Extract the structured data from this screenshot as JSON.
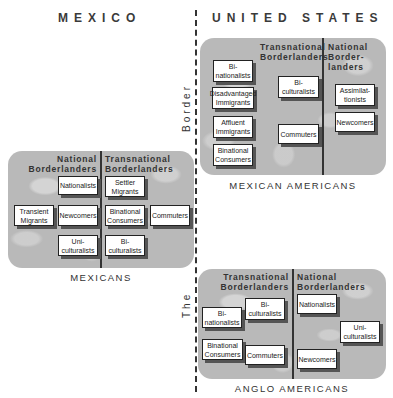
{
  "titles": {
    "mexico": "MEXICO",
    "united_states": "UNITED STATES"
  },
  "border_label": {
    "word1": "The",
    "word2": "Border"
  },
  "panels": {
    "mexican_americans": {
      "label": "MEXICAN AMERICANS",
      "columns": {
        "left": "Transnational Borderlanders",
        "right_line1": "National",
        "right_line2": "Border-",
        "right_line3": "landers",
        "left_line1": "Transnational",
        "left_line2": "Borderlanders"
      },
      "boxes": {
        "binationalists": "Bi-nationalists",
        "disadvantaged_immigrants": "Disadvantaged Immigrants",
        "affluent_immigrants": "Affluent Immigrants",
        "binational_consumers": "Binational Consumers",
        "biculturalists": "Bi-culturalists",
        "commuters": "Commuters",
        "assimilationists": "Assimilat-tionists",
        "newcomers": "Newcomers"
      }
    },
    "mexicans": {
      "label": "MEXICANS",
      "columns": {
        "left_line1": "National",
        "left_line2": "Borderlanders",
        "right_line1": "Transnational",
        "right_line2": "Borderlanders"
      },
      "boxes": {
        "nationalists": "Nationalists",
        "settler_migrants": "Settler Migrants",
        "transient_migrants": "Transient Migrants",
        "newcomers": "Newcomers",
        "binational_consumers": "Binational Consumers",
        "commuters": "Commuters",
        "uniculturalists": "Uni-culturalists",
        "biculturalists": "Bi-culturalists"
      }
    },
    "anglo_americans": {
      "label": "ANGLO AMERICANS",
      "columns": {
        "left_line1": "Transnational",
        "left_line2": "Borderlanders",
        "right_line1": "National",
        "right_line2": "Borderlanders"
      },
      "boxes": {
        "binationalists": "Bi-nationalists",
        "biculturalists": "Bi-culturalists",
        "binational_consumers": "Binational Consumers",
        "commuters": "Commuters",
        "nationalists": "Nationalists",
        "uniculturalists": "Uni-culturalists",
        "newcomers": "Newcomers"
      }
    }
  }
}
